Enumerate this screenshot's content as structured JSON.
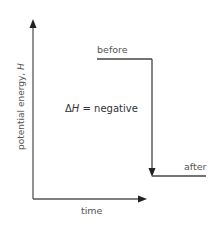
{
  "diagram": {
    "type": "energy-level-diagram",
    "y_axis_label": "potential energy, ",
    "y_axis_var": "H",
    "x_axis_label": "time",
    "levels": [
      {
        "name": "before",
        "label": "before"
      },
      {
        "name": "after",
        "label": "after"
      }
    ],
    "delta_symbol": "Δ",
    "delta_var": "H",
    "delta_text": " = negative",
    "colors": {
      "axis": "#333333",
      "line": "#444444",
      "text": "#555555"
    }
  }
}
